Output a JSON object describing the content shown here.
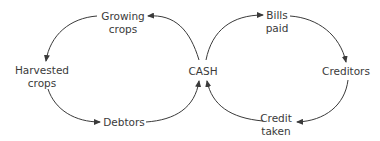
{
  "diagram": {
    "center": {
      "label": "CASH"
    },
    "left_loop": {
      "nodes": [
        {
          "id": "growing",
          "line1": "Growing",
          "line2": "crops"
        },
        {
          "id": "harvested",
          "line1": "Harvested",
          "line2": "crops"
        },
        {
          "id": "debtors",
          "line1": "Debtors",
          "line2": ""
        }
      ],
      "flow": [
        "CASH",
        "Growing crops",
        "Harvested crops",
        "Debtors",
        "CASH"
      ]
    },
    "right_loop": {
      "nodes": [
        {
          "id": "bills",
          "line1": "Bills",
          "line2": "paid"
        },
        {
          "id": "creditors",
          "line1": "Creditors",
          "line2": ""
        },
        {
          "id": "credit",
          "line1": "Credit",
          "line2": "taken"
        }
      ],
      "flow": [
        "CASH",
        "Bills paid",
        "Creditors",
        "Credit taken",
        "CASH"
      ]
    },
    "colors": {
      "line": "#3a3a3a",
      "text": "#3a3a3a",
      "background": "#ffffff"
    }
  }
}
